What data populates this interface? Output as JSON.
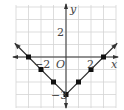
{
  "chart_data": {
    "type": "line",
    "title": "",
    "function": "y = |x| - 3",
    "xlabel": "x",
    "ylabel": "y",
    "origin_label": "O",
    "xlim": [
      -4,
      4
    ],
    "ylim": [
      -4,
      4
    ],
    "grid": true,
    "tick_labels": {
      "x": [
        "-2",
        "2"
      ],
      "y": [
        "2",
        "-3"
      ]
    },
    "points": [
      [
        -3,
        0
      ],
      [
        -2,
        -1
      ],
      [
        -1,
        -2
      ],
      [
        0,
        -3
      ],
      [
        1,
        -2
      ],
      [
        2,
        -1
      ],
      [
        3,
        0
      ]
    ],
    "line_extends_to": [
      [
        -4.1,
        1.1
      ],
      [
        4.1,
        1.1
      ]
    ]
  },
  "labels": {
    "x_axis": "x",
    "y_axis": "y",
    "origin": "O",
    "x_neg2": "−2",
    "x_pos2": "2",
    "y_pos2": "2",
    "y_neg3": "−3"
  },
  "colors": {
    "grid": "#d0d0d0",
    "axis": "#333333",
    "line": "#333333",
    "point": "#111111"
  }
}
